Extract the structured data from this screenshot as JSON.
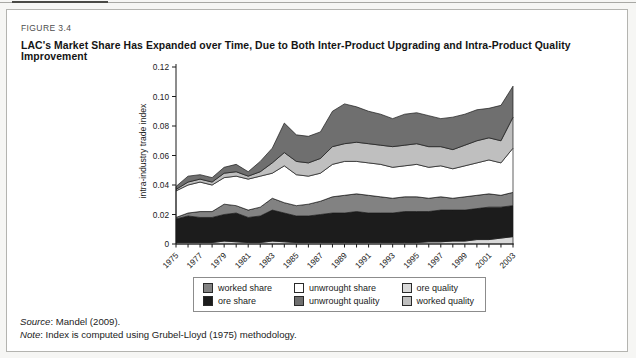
{
  "figure": {
    "label": "FIGURE 3.4",
    "title": "LAC's Market Share Has Expanded over Time, Due to Both Inter-Product Upgrading and Intra-Product Quality Improvement"
  },
  "footer": {
    "source_label": "Source",
    "source_text": ": Mandel (2009).",
    "note_label": "Note",
    "note_text": ": Index is computed using Grubel-Lloyd (1975) methodology."
  },
  "chart_data": {
    "type": "area",
    "stacked": true,
    "title": "",
    "xlabel": "",
    "ylabel": "intra-industry trade index",
    "ylim": [
      0,
      0.12
    ],
    "grid": false,
    "legend_position": "bottom",
    "x": [
      1975,
      1976,
      1977,
      1978,
      1979,
      1980,
      1981,
      1982,
      1983,
      1984,
      1985,
      1986,
      1987,
      1988,
      1989,
      1990,
      1991,
      1992,
      1993,
      1994,
      1995,
      1996,
      1997,
      1998,
      1999,
      2000,
      2001,
      2002,
      2003
    ],
    "x_tick_labels": [
      "1975",
      "1977",
      "1979",
      "1981",
      "1983",
      "1985",
      "1987",
      "1989",
      "1991",
      "1993",
      "1995",
      "1997",
      "1999",
      "2001",
      "2003"
    ],
    "y_ticks": [
      {
        "value": 0,
        "label": "0"
      },
      {
        "value": 0.02,
        "label": "0.02"
      },
      {
        "value": 0.04,
        "label": "0.04"
      },
      {
        "value": 0.06,
        "label": "0.06"
      },
      {
        "value": 0.08,
        "label": "0.08"
      },
      {
        "value": 0.1,
        "label": "0.10"
      },
      {
        "value": 0.12,
        "label": "0.12"
      }
    ],
    "series": [
      {
        "name": "ore quality",
        "color": "#d9d9d9",
        "values": [
          0.001,
          0.001,
          0.001,
          0.001,
          0.002,
          0.0015,
          0.001,
          0.001,
          0.002,
          0.0015,
          0.001,
          0.001,
          0.001,
          0.001,
          0.001,
          0.001,
          0.001,
          0.001,
          0.001,
          0.001,
          0.001,
          0.0015,
          0.0015,
          0.002,
          0.002,
          0.003,
          0.003,
          0.004,
          0.005
        ]
      },
      {
        "name": "ore share",
        "color": "#1c1c1c",
        "values": [
          0.016,
          0.018,
          0.017,
          0.017,
          0.018,
          0.0195,
          0.017,
          0.018,
          0.021,
          0.0195,
          0.018,
          0.018,
          0.019,
          0.02,
          0.02,
          0.021,
          0.02,
          0.02,
          0.02,
          0.021,
          0.021,
          0.0205,
          0.0215,
          0.021,
          0.021,
          0.021,
          0.022,
          0.021,
          0.021
        ]
      },
      {
        "name": "worked share",
        "color": "#828282",
        "values": [
          0.001,
          0.002,
          0.004,
          0.004,
          0.007,
          0.005,
          0.005,
          0.006,
          0.008,
          0.007,
          0.007,
          0.008,
          0.009,
          0.011,
          0.012,
          0.012,
          0.012,
          0.011,
          0.01,
          0.01,
          0.01,
          0.009,
          0.009,
          0.008,
          0.009,
          0.009,
          0.009,
          0.008,
          0.009
        ]
      },
      {
        "name": "unwrought share",
        "color": "#ffffff",
        "values": [
          0.018,
          0.019,
          0.02,
          0.018,
          0.018,
          0.02,
          0.021,
          0.021,
          0.017,
          0.025,
          0.021,
          0.019,
          0.019,
          0.022,
          0.023,
          0.022,
          0.022,
          0.022,
          0.021,
          0.021,
          0.022,
          0.021,
          0.021,
          0.02,
          0.021,
          0.022,
          0.023,
          0.022,
          0.03
        ]
      },
      {
        "name": "worked quality",
        "color": "#bfbfbf",
        "values": [
          0.001,
          0.002,
          0.002,
          0.002,
          0.003,
          0.003,
          0.002,
          0.003,
          0.007,
          0.009,
          0.009,
          0.009,
          0.01,
          0.012,
          0.012,
          0.013,
          0.013,
          0.013,
          0.014,
          0.014,
          0.014,
          0.014,
          0.013,
          0.013,
          0.014,
          0.015,
          0.015,
          0.015,
          0.021
        ]
      },
      {
        "name": "unwrought quality",
        "color": "#6f6f6f",
        "values": [
          0.002,
          0.004,
          0.003,
          0.003,
          0.004,
          0.005,
          0.003,
          0.007,
          0.01,
          0.02,
          0.018,
          0.018,
          0.018,
          0.024,
          0.027,
          0.024,
          0.022,
          0.021,
          0.019,
          0.021,
          0.021,
          0.021,
          0.019,
          0.022,
          0.021,
          0.021,
          0.02,
          0.024,
          0.021
        ]
      }
    ],
    "legend": [
      {
        "label": "worked share",
        "series": "worked share"
      },
      {
        "label": "unwrought share",
        "series": "unwrought share"
      },
      {
        "label": "ore quality",
        "series": "ore quality"
      },
      {
        "label": "ore share",
        "series": "ore share"
      },
      {
        "label": "unwrought quality",
        "series": "unwrought quality"
      },
      {
        "label": "worked quality",
        "series": "worked quality"
      }
    ],
    "axis_color": "#1a1a1a",
    "band_outline_color": "#1a1a1a"
  }
}
